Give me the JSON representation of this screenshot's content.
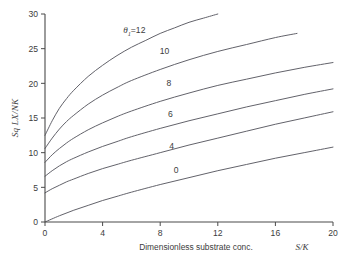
{
  "chart_data": {
    "type": "line",
    "title": "",
    "subtitle": "",
    "xlabel": "Dimensionless substrate conc.",
    "xlabel_symbol": "S/K",
    "ylabel": "Sq LX/NK",
    "xlim": [
      0,
      20
    ],
    "ylim": [
      0,
      30
    ],
    "xticks": [
      0,
      4,
      8,
      12,
      16,
      20
    ],
    "yticks": [
      0,
      5,
      10,
      15,
      20,
      25,
      30
    ],
    "grid": false,
    "legend_position": "inline-curve-labels",
    "series_parameter_symbol": "θ",
    "series_parameter_subscript": "1",
    "first_label_text": "θ₁ = 12",
    "series": [
      {
        "name": "12",
        "label": "12",
        "label_prefix": "θ₁=",
        "label_x": 6.2,
        "label_y": 27.2,
        "x": [
          0,
          0.5,
          1,
          1.5,
          2,
          3,
          4,
          5,
          6,
          7,
          8,
          9,
          10,
          11,
          12,
          13
        ],
        "values": [
          12.5,
          14.6,
          16.4,
          17.8,
          19.0,
          21.0,
          22.6,
          24.0,
          25.2,
          26.2,
          27.2,
          28.0,
          28.8,
          29.4,
          30.0,
          30.4
        ]
      },
      {
        "name": "10",
        "label": "10",
        "label_x": 8.3,
        "label_y": 24.2,
        "x": [
          0,
          0.5,
          1,
          1.5,
          2,
          3,
          4,
          5,
          6,
          8,
          10,
          12,
          14,
          16,
          17.5
        ],
        "values": [
          10.6,
          12.1,
          13.4,
          14.5,
          15.4,
          17.0,
          18.3,
          19.4,
          20.4,
          22.0,
          23.4,
          24.6,
          25.6,
          26.6,
          27.2
        ]
      },
      {
        "name": "8",
        "label": "8",
        "label_x": 8.6,
        "label_y": 19.6,
        "x": [
          0,
          0.5,
          1,
          1.5,
          2,
          3,
          4,
          5,
          6,
          8,
          10,
          12,
          14,
          16,
          18,
          20
        ],
        "values": [
          8.6,
          9.7,
          10.6,
          11.4,
          12.1,
          13.3,
          14.3,
          15.2,
          16.0,
          17.4,
          18.6,
          19.7,
          20.6,
          21.5,
          22.3,
          23.0
        ]
      },
      {
        "name": "6",
        "label": "6",
        "label_x": 8.7,
        "label_y": 15.1,
        "x": [
          0,
          0.5,
          1,
          1.5,
          2,
          3,
          4,
          5,
          6,
          8,
          10,
          12,
          14,
          16,
          18,
          20
        ],
        "values": [
          6.6,
          7.4,
          8.1,
          8.7,
          9.2,
          10.1,
          10.9,
          11.6,
          12.3,
          13.5,
          14.6,
          15.6,
          16.6,
          17.5,
          18.4,
          19.2
        ]
      },
      {
        "name": "4",
        "label": "4",
        "label_x": 8.8,
        "label_y": 10.6,
        "x": [
          0,
          0.5,
          1,
          1.5,
          2,
          3,
          4,
          5,
          6,
          8,
          10,
          12,
          14,
          16,
          18,
          20
        ],
        "values": [
          4.2,
          4.8,
          5.3,
          5.8,
          6.2,
          7.0,
          7.7,
          8.3,
          8.9,
          10.0,
          11.1,
          12.1,
          13.1,
          14.1,
          15.0,
          15.9
        ]
      },
      {
        "name": "0",
        "label": "0",
        "label_x": 9.1,
        "label_y": 7.1,
        "x": [
          0,
          1,
          2,
          3,
          4,
          5,
          6,
          8,
          10,
          12,
          14,
          16,
          18,
          20
        ],
        "values": [
          0,
          0.9,
          1.7,
          2.4,
          3.1,
          3.7,
          4.3,
          5.4,
          6.4,
          7.4,
          8.3,
          9.2,
          10.0,
          10.8
        ]
      }
    ]
  },
  "figure": {
    "background_color": "#ffffff",
    "line_color": "#5a5a62",
    "axis_color": "#4a4a4a",
    "text_color": "#3c3c3c"
  }
}
